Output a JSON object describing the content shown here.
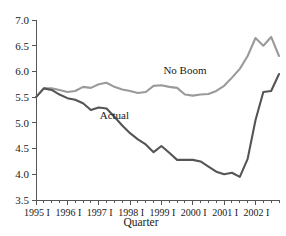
{
  "chart_data": {
    "type": "line",
    "title": "",
    "xlabel": "Quarter",
    "ylabel": "",
    "ylim": [
      3.5,
      7.0
    ],
    "ytick_step": 0.5,
    "yticks": [
      "3.5",
      "4.0",
      "4.5",
      "5.0",
      "5.5",
      "6.0",
      "6.5",
      "7.0"
    ],
    "xticks": [
      "1995 I",
      "1996 I",
      "1997 I",
      "1998 I",
      "1999 I",
      "2000 I",
      "2001 I",
      "2002 I"
    ],
    "x_minor_ticks_per_major": 4,
    "grid": false,
    "legend_position": "inline-annotation",
    "x_quarters": [
      "1995 I",
      "1995 II",
      "1995 III",
      "1995 IV",
      "1996 I",
      "1996 II",
      "1996 III",
      "1996 IV",
      "1997 I",
      "1997 II",
      "1997 III",
      "1997 IV",
      "1998 I",
      "1998 II",
      "1998 III",
      "1998 IV",
      "1999 I",
      "1999 II",
      "1999 III",
      "1999 IV",
      "2000 I",
      "2000 II",
      "2000 III",
      "2000 IV",
      "2001 I",
      "2001 II",
      "2001 III",
      "2001 IV",
      "2002 I",
      "2002 II",
      "2002 III",
      "2002 IV"
    ],
    "series": [
      {
        "name": "No Boom",
        "color": "#9a9a9a",
        "label_x": "1999 IV",
        "label_y": 5.95,
        "values": [
          5.5,
          5.67,
          5.67,
          5.64,
          5.6,
          5.62,
          5.7,
          5.68,
          5.75,
          5.78,
          5.7,
          5.65,
          5.62,
          5.58,
          5.6,
          5.72,
          5.73,
          5.7,
          5.68,
          5.55,
          5.53,
          5.55,
          5.56,
          5.62,
          5.72,
          5.88,
          6.05,
          6.3,
          6.65,
          6.5,
          6.67,
          6.3
        ]
      },
      {
        "name": "Actual",
        "color": "#555555",
        "label_x": "1997 III",
        "label_y": 5.08,
        "values": [
          5.5,
          5.67,
          5.64,
          5.55,
          5.48,
          5.45,
          5.38,
          5.25,
          5.3,
          5.28,
          5.12,
          4.95,
          4.8,
          4.68,
          4.58,
          4.43,
          4.55,
          4.42,
          4.28,
          4.28,
          4.28,
          4.25,
          4.15,
          4.05,
          4.0,
          4.03,
          3.95,
          4.3,
          5.05,
          5.6,
          5.62,
          5.95
        ]
      }
    ]
  }
}
